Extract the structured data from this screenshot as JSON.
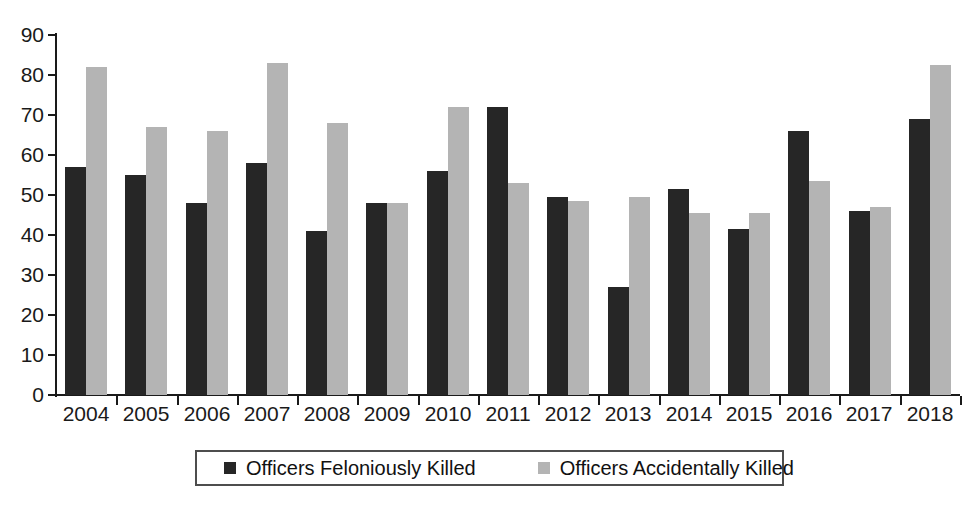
{
  "chart_data": {
    "type": "bar",
    "title": "",
    "subtitle": "",
    "xlabel": "",
    "ylabel": "",
    "ylim": [
      0,
      90
    ],
    "ytick_step": 10,
    "yticks": [
      0,
      10,
      20,
      30,
      40,
      50,
      60,
      70,
      80,
      90
    ],
    "grid": false,
    "legend_position": "bottom",
    "categories": [
      "2004",
      "2005",
      "2006",
      "2007",
      "2008",
      "2009",
      "2010",
      "2011",
      "2012",
      "2013",
      "2014",
      "2015",
      "2016",
      "2017",
      "2018"
    ],
    "series": [
      {
        "name": "Officers Feloniously Killed",
        "color": "#262626",
        "values": [
          57,
          55,
          48,
          58,
          41,
          48,
          56,
          72,
          49.5,
          27,
          51.5,
          41.5,
          66,
          46,
          69
        ]
      },
      {
        "name": "Officers Accidentally Killed",
        "color": "#b4b4b4",
        "values": [
          82,
          67,
          66,
          83,
          68,
          48,
          72,
          53,
          48.5,
          49.5,
          45.5,
          45.5,
          53.5,
          47,
          82.5
        ]
      }
    ]
  },
  "legend": {
    "entries": [
      {
        "label": "Officers Feloniously Killed",
        "swatch": "felonious-swatch"
      },
      {
        "label": "Officers Accidentally Killed",
        "swatch": "accidental-swatch"
      }
    ]
  },
  "colors": {
    "felonious": "#262626",
    "accidental": "#b4b4b4",
    "axis": "#1a1a1a",
    "text": "#111111",
    "background": "#ffffff",
    "legend_border": "#4d4d4d"
  }
}
